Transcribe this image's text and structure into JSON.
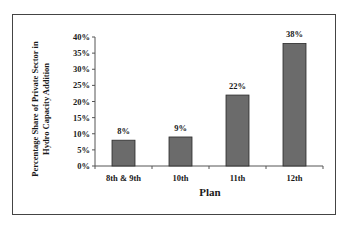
{
  "chart_data": {
    "type": "bar",
    "title": "",
    "categories": [
      "8th & 9th",
      "10th",
      "11th",
      "12th"
    ],
    "values": [
      8,
      9,
      22,
      38
    ],
    "data_labels": [
      "8%",
      "9%",
      "22%",
      "38%"
    ],
    "xlabel": "Plan",
    "ylabel": "Percentage Share of  Private Sector in Hydro Capacity Addition",
    "ylabel_lines": [
      "Percentage Share of  Private Sector in",
      "Hydro Capacity Addition"
    ],
    "ylim": [
      0,
      40
    ],
    "yticks": [
      "0%",
      "5%",
      "10%",
      "15%",
      "20%",
      "25%",
      "30%",
      "35%",
      "40%"
    ],
    "grid": false,
    "legend": null,
    "colors": {
      "bar_fill": "#6b6b6b",
      "bar_stroke": "#2a2a2a",
      "axis": "#555555"
    }
  }
}
